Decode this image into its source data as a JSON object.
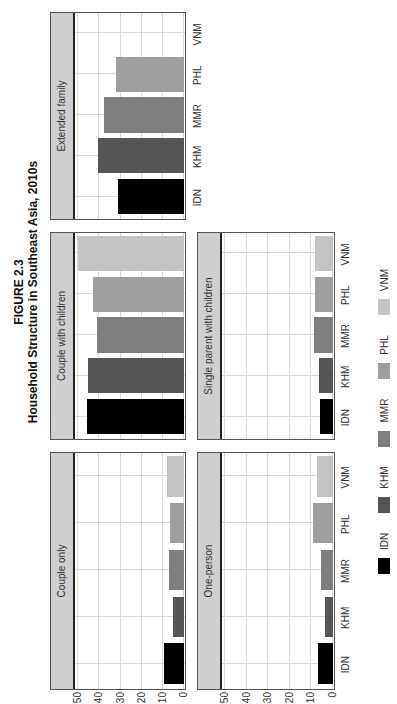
{
  "figure": {
    "label": "FIGURE 2.3",
    "title": "Household Structure in Southeast Asia, 2010s"
  },
  "colors": {
    "IDN": "#000000",
    "KHM": "#555555",
    "MMR": "#7f7f7f",
    "PHL": "#9e9e9e",
    "VNM": "#c4c4c4"
  },
  "axis": {
    "y_ticks": [
      "50",
      "40",
      "30",
      "20",
      "10",
      "0"
    ],
    "categories": [
      "IDN",
      "KHM",
      "MMR",
      "PHL",
      "VNM"
    ]
  },
  "legend": [
    {
      "label": "IDN"
    },
    {
      "label": "KHM"
    },
    {
      "label": "MMR"
    },
    {
      "label": "PHL"
    },
    {
      "label": "VNM"
    }
  ],
  "chart_data": {
    "type": "bar",
    "title": "FIGURE 2.3 Household Structure in Southeast Asia, 2010s",
    "layout": "faceted small multiples (2 rows x 3 cols, last cell empty), image rotated 90° counter-clockwise",
    "categories": [
      "IDN",
      "KHM",
      "MMR",
      "PHL",
      "VNM"
    ],
    "xlabel": "",
    "ylabel": "",
    "ylim": [
      0,
      50
    ],
    "yticks": [
      0,
      10,
      20,
      30,
      40,
      50
    ],
    "grid": true,
    "legend_position": "bottom",
    "panels": [
      {
        "name": "Couple only",
        "values": [
          9.5,
          5,
          7,
          6.5,
          8
        ]
      },
      {
        "name": "Couple with children",
        "values": [
          46,
          45.5,
          41,
          43,
          50
        ]
      },
      {
        "name": "Extended family",
        "values": [
          31,
          40.5,
          38,
          32,
          0
        ]
      },
      {
        "name": "One-person",
        "values": [
          7,
          3.5,
          5.5,
          9.5,
          7.5
        ]
      },
      {
        "name": "Single parent with children",
        "values": [
          6,
          6.5,
          9,
          8.5,
          8.5
        ]
      }
    ]
  }
}
